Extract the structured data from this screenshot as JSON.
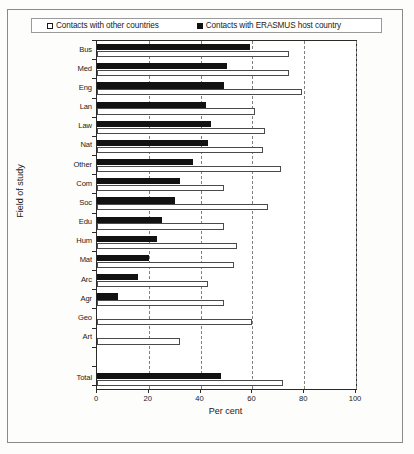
{
  "figure": {
    "legend": {
      "entries": [
        {
          "label": "Contacts with other countries",
          "swatch": "hollow-square-icon",
          "color": "#ffffff"
        },
        {
          "label": "Contacts with ERASMUS host country",
          "swatch": "solid-square-icon",
          "color": "#121212"
        }
      ]
    }
  },
  "chart_data": {
    "type": "bar",
    "orientation": "horizontal",
    "title": "",
    "xlabel": "Per cent",
    "ylabel": "Field of study",
    "xlim": [
      0,
      100
    ],
    "xticks": [
      0,
      20,
      40,
      60,
      80,
      100
    ],
    "grid": "vertical-dashed",
    "legend_position": "top",
    "categories": [
      "Bus",
      "Med",
      "Eng",
      "Lan",
      "Law",
      "Nat",
      "Other",
      "Com",
      "Soc",
      "Edu",
      "Hum",
      "Mat",
      "Arc",
      "Agr",
      "Geo",
      "Art",
      "Total"
    ],
    "series": [
      {
        "name": "Contacts with ERASMUS host country",
        "color": "#121212",
        "values": [
          59,
          50,
          49,
          42,
          44,
          43,
          37,
          32,
          30,
          25,
          23,
          20,
          16,
          8,
          0,
          0,
          48
        ]
      },
      {
        "name": "Contacts with other countries",
        "color": "#ffffff",
        "values": [
          74,
          74,
          79,
          61,
          65,
          64,
          71,
          49,
          66,
          49,
          54,
          53,
          43,
          49,
          60,
          32,
          72
        ]
      }
    ]
  }
}
